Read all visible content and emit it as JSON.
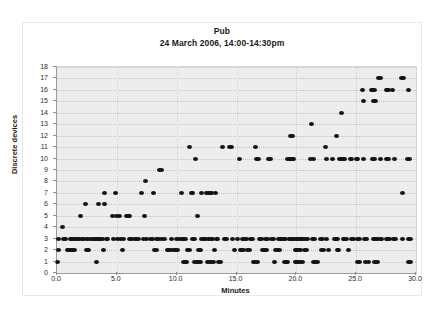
{
  "chart_data": {
    "type": "scatter",
    "title": "Pub",
    "subtitle": "24 March 2006, 14:00-14:30pm",
    "xlabel": "Minutes",
    "ylabel": "Discrete devices",
    "xlim": [
      0,
      30
    ],
    "ylim": [
      0,
      18
    ],
    "xticks": [
      "0.0",
      "5.0",
      "10.0",
      "15.0",
      "20.0",
      "25.0",
      "30.0"
    ],
    "xtick_values": [
      0,
      5,
      10,
      15,
      20,
      25,
      30
    ],
    "yticks": [
      "0",
      "1",
      "2",
      "3",
      "4",
      "5",
      "6",
      "7",
      "8",
      "9",
      "10",
      "11",
      "12",
      "13",
      "14",
      "15",
      "16",
      "17",
      "18"
    ],
    "ytick_values": [
      0,
      1,
      2,
      3,
      4,
      5,
      6,
      7,
      8,
      9,
      10,
      11,
      12,
      13,
      14,
      15,
      16,
      17,
      18
    ],
    "grid": true,
    "grid_style": "dotted horizontal and vertical",
    "legend": "none",
    "marker": "filled-circle",
    "marker_color": "#121212",
    "plot_background": "#ededed",
    "series": [
      {
        "name": "Discrete devices observed",
        "points": [
          [
            0.05,
            1
          ],
          [
            0.1,
            2
          ],
          [
            0.15,
            3
          ],
          [
            0.5,
            4
          ],
          [
            0.55,
            3
          ],
          [
            0.75,
            3
          ],
          [
            0.9,
            2
          ],
          [
            1.0,
            2
          ],
          [
            1.15,
            2
          ],
          [
            1.3,
            2
          ],
          [
            1.45,
            2
          ],
          [
            1.1,
            3
          ],
          [
            1.25,
            3
          ],
          [
            1.4,
            3
          ],
          [
            1.55,
            3
          ],
          [
            1.7,
            3
          ],
          [
            1.85,
            3
          ],
          [
            2.0,
            5
          ],
          [
            2.1,
            3
          ],
          [
            2.25,
            3
          ],
          [
            2.4,
            6
          ],
          [
            2.45,
            3
          ],
          [
            2.6,
            3
          ],
          [
            2.5,
            2
          ],
          [
            2.65,
            2
          ],
          [
            2.9,
            3
          ],
          [
            3.05,
            3
          ],
          [
            3.2,
            3
          ],
          [
            3.35,
            3
          ],
          [
            3.3,
            1
          ],
          [
            3.45,
            6
          ],
          [
            3.5,
            3
          ],
          [
            3.65,
            3
          ],
          [
            3.95,
            7
          ],
          [
            3.8,
            3
          ],
          [
            3.9,
            2
          ],
          [
            4.0,
            6
          ],
          [
            4.1,
            3
          ],
          [
            4.25,
            3
          ],
          [
            4.6,
            5
          ],
          [
            4.75,
            3
          ],
          [
            4.9,
            7
          ],
          [
            5.0,
            5
          ],
          [
            5.05,
            3
          ],
          [
            5.25,
            5
          ],
          [
            5.3,
            3
          ],
          [
            5.5,
            2
          ],
          [
            5.55,
            3
          ],
          [
            5.8,
            5
          ],
          [
            5.95,
            5
          ],
          [
            6.05,
            5
          ],
          [
            6.1,
            3
          ],
          [
            6.25,
            3
          ],
          [
            6.5,
            3
          ],
          [
            6.65,
            3
          ],
          [
            6.8,
            3
          ],
          [
            7.1,
            7
          ],
          [
            7.2,
            3
          ],
          [
            7.4,
            8
          ],
          [
            7.35,
            5
          ],
          [
            7.5,
            3
          ],
          [
            7.8,
            3
          ],
          [
            7.95,
            3
          ],
          [
            8.1,
            7
          ],
          [
            8.15,
            2
          ],
          [
            8.3,
            2
          ],
          [
            8.35,
            3
          ],
          [
            8.5,
            3
          ],
          [
            8.6,
            9
          ],
          [
            8.7,
            9
          ],
          [
            8.75,
            3
          ],
          [
            9.0,
            3
          ],
          [
            9.2,
            2
          ],
          [
            9.35,
            2
          ],
          [
            9.5,
            2
          ],
          [
            9.6,
            3
          ],
          [
            9.75,
            2
          ],
          [
            9.9,
            2
          ],
          [
            10.0,
            3
          ],
          [
            10.1,
            2
          ],
          [
            10.2,
            3
          ],
          [
            10.4,
            7
          ],
          [
            10.45,
            3
          ],
          [
            10.55,
            1
          ],
          [
            10.7,
            1
          ],
          [
            10.85,
            1
          ],
          [
            10.6,
            3
          ],
          [
            10.75,
            3
          ],
          [
            10.9,
            2
          ],
          [
            11.05,
            2
          ],
          [
            11.1,
            11
          ],
          [
            11.2,
            7
          ],
          [
            11.35,
            7
          ],
          [
            11.3,
            3
          ],
          [
            11.45,
            3
          ],
          [
            11.5,
            1
          ],
          [
            11.65,
            1
          ],
          [
            11.8,
            1
          ],
          [
            11.95,
            1
          ],
          [
            11.6,
            10
          ],
          [
            11.75,
            5
          ],
          [
            11.85,
            2
          ],
          [
            12.0,
            2
          ],
          [
            12.05,
            7
          ],
          [
            12.1,
            3
          ],
          [
            12.25,
            3
          ],
          [
            12.4,
            3
          ],
          [
            12.5,
            7
          ],
          [
            12.65,
            7
          ],
          [
            12.8,
            7
          ],
          [
            12.95,
            7
          ],
          [
            12.6,
            1
          ],
          [
            12.75,
            1
          ],
          [
            12.9,
            1
          ],
          [
            13.05,
            1
          ],
          [
            12.7,
            3
          ],
          [
            12.85,
            3
          ],
          [
            13.0,
            3
          ],
          [
            13.15,
            2
          ],
          [
            13.25,
            7
          ],
          [
            13.3,
            3
          ],
          [
            13.45,
            3
          ],
          [
            13.5,
            1
          ],
          [
            13.65,
            1
          ],
          [
            13.85,
            11
          ],
          [
            14.0,
            3
          ],
          [
            14.2,
            3
          ],
          [
            14.4,
            11
          ],
          [
            14.6,
            11
          ],
          [
            14.7,
            3
          ],
          [
            14.85,
            2
          ],
          [
            15.1,
            3
          ],
          [
            15.25,
            10
          ],
          [
            15.3,
            2
          ],
          [
            15.45,
            2
          ],
          [
            15.6,
            2
          ],
          [
            15.5,
            3
          ],
          [
            15.65,
            3
          ],
          [
            15.8,
            3
          ],
          [
            15.9,
            2
          ],
          [
            16.05,
            2
          ],
          [
            16.2,
            3
          ],
          [
            16.35,
            3
          ],
          [
            16.45,
            1
          ],
          [
            16.6,
            1
          ],
          [
            16.75,
            1
          ],
          [
            16.6,
            11
          ],
          [
            16.7,
            10
          ],
          [
            16.85,
            10
          ],
          [
            16.9,
            3
          ],
          [
            17.05,
            3
          ],
          [
            17.2,
            2
          ],
          [
            17.35,
            2
          ],
          [
            17.5,
            2
          ],
          [
            17.4,
            3
          ],
          [
            17.55,
            3
          ],
          [
            17.65,
            10
          ],
          [
            17.85,
            10
          ],
          [
            17.95,
            3
          ],
          [
            18.1,
            3
          ],
          [
            18.2,
            1
          ],
          [
            18.3,
            2
          ],
          [
            18.45,
            2
          ],
          [
            18.6,
            2
          ],
          [
            18.5,
            3
          ],
          [
            18.65,
            3
          ],
          [
            18.8,
            3
          ],
          [
            18.95,
            3
          ],
          [
            19.1,
            3
          ],
          [
            19.0,
            1
          ],
          [
            19.15,
            1
          ],
          [
            19.3,
            1
          ],
          [
            19.3,
            10
          ],
          [
            19.45,
            10
          ],
          [
            19.55,
            10
          ],
          [
            19.7,
            10
          ],
          [
            19.8,
            10
          ],
          [
            19.5,
            12
          ],
          [
            19.65,
            12
          ],
          [
            19.4,
            3
          ],
          [
            19.55,
            3
          ],
          [
            19.7,
            3
          ],
          [
            19.85,
            3
          ],
          [
            20.0,
            3
          ],
          [
            20.15,
            3
          ],
          [
            20.3,
            3
          ],
          [
            20.45,
            3
          ],
          [
            19.9,
            2
          ],
          [
            20.05,
            2
          ],
          [
            20.2,
            2
          ],
          [
            20.35,
            2
          ],
          [
            19.9,
            1
          ],
          [
            20.05,
            1
          ],
          [
            20.2,
            1
          ],
          [
            20.35,
            1
          ],
          [
            20.5,
            1
          ],
          [
            20.6,
            3
          ],
          [
            20.75,
            3
          ],
          [
            20.9,
            3
          ],
          [
            20.7,
            2
          ],
          [
            20.85,
            2
          ],
          [
            21.3,
            13
          ],
          [
            21.2,
            10
          ],
          [
            21.4,
            10
          ],
          [
            21.35,
            3
          ],
          [
            21.5,
            3
          ],
          [
            21.45,
            1
          ],
          [
            21.6,
            1
          ],
          [
            21.75,
            1
          ],
          [
            22.0,
            3
          ],
          [
            22.15,
            3
          ],
          [
            22.1,
            2
          ],
          [
            22.25,
            2
          ],
          [
            22.4,
            11
          ],
          [
            22.55,
            10
          ],
          [
            22.5,
            3
          ],
          [
            22.65,
            2
          ],
          [
            23.0,
            10
          ],
          [
            23.15,
            3
          ],
          [
            23.3,
            3
          ],
          [
            23.45,
            3
          ],
          [
            23.35,
            12
          ],
          [
            23.75,
            14
          ],
          [
            23.4,
            2
          ],
          [
            23.55,
            2
          ],
          [
            23.6,
            10
          ],
          [
            23.75,
            10
          ],
          [
            23.9,
            10
          ],
          [
            24.05,
            10
          ],
          [
            23.9,
            3
          ],
          [
            24.05,
            3
          ],
          [
            24.2,
            3
          ],
          [
            24.35,
            2
          ],
          [
            24.5,
            10
          ],
          [
            24.65,
            10
          ],
          [
            24.6,
            3
          ],
          [
            24.75,
            3
          ],
          [
            25.0,
            10
          ],
          [
            25.15,
            10
          ],
          [
            25.1,
            3
          ],
          [
            25.25,
            3
          ],
          [
            25.1,
            1
          ],
          [
            25.3,
            1
          ],
          [
            25.5,
            16
          ],
          [
            25.6,
            15
          ],
          [
            25.65,
            10
          ],
          [
            25.7,
            3
          ],
          [
            25.85,
            3
          ],
          [
            25.8,
            1
          ],
          [
            26.0,
            1
          ],
          [
            26.3,
            16
          ],
          [
            26.4,
            16
          ],
          [
            26.5,
            16
          ],
          [
            26.45,
            15
          ],
          [
            26.6,
            15
          ],
          [
            26.35,
            10
          ],
          [
            26.5,
            10
          ],
          [
            26.45,
            3
          ],
          [
            26.6,
            3
          ],
          [
            26.75,
            3
          ],
          [
            26.5,
            1
          ],
          [
            26.65,
            1
          ],
          [
            26.8,
            1
          ],
          [
            26.9,
            17
          ],
          [
            27.05,
            17
          ],
          [
            27.0,
            10
          ],
          [
            27.0,
            3
          ],
          [
            27.15,
            3
          ],
          [
            27.5,
            16
          ],
          [
            27.6,
            16
          ],
          [
            27.7,
            16
          ],
          [
            27.55,
            10
          ],
          [
            27.7,
            10
          ],
          [
            27.5,
            3
          ],
          [
            27.65,
            3
          ],
          [
            27.8,
            3
          ],
          [
            28.05,
            16
          ],
          [
            28.2,
            10
          ],
          [
            28.1,
            3
          ],
          [
            28.25,
            3
          ],
          [
            28.8,
            17
          ],
          [
            28.95,
            17
          ],
          [
            28.85,
            7
          ],
          [
            28.9,
            3
          ],
          [
            29.4,
            16
          ],
          [
            29.3,
            10
          ],
          [
            29.45,
            10
          ],
          [
            29.35,
            3
          ],
          [
            29.5,
            3
          ],
          [
            29.4,
            1
          ],
          [
            29.55,
            1
          ]
        ]
      }
    ]
  },
  "axes": {
    "y_title": "Discrete devices",
    "x_title": "Minutes"
  }
}
